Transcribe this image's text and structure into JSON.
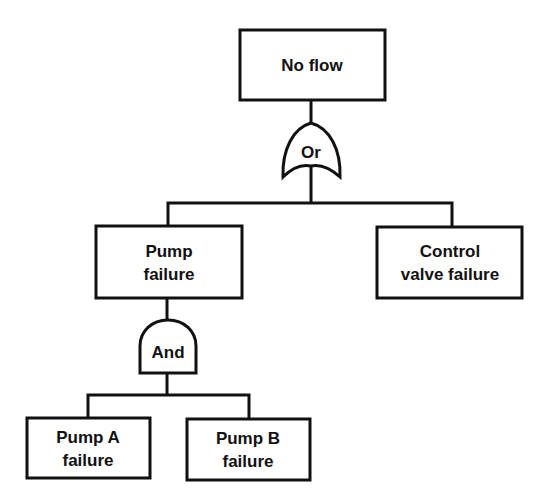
{
  "diagram": {
    "type": "fault-tree",
    "colors": {
      "stroke": "#111111",
      "background": "#ffffff",
      "text": "#111111"
    },
    "top_event": {
      "line1": "No flow"
    },
    "gates": {
      "or_gate": {
        "label": "Or"
      },
      "and_gate": {
        "label": "And"
      }
    },
    "events": {
      "pump_failure": {
        "line1": "Pump",
        "line2": "failure"
      },
      "control_valve_failure": {
        "line1": "Control",
        "line2": "valve failure"
      },
      "pump_a_failure": {
        "line1": "Pump A",
        "line2": "failure"
      },
      "pump_b_failure": {
        "line1": "Pump B",
        "line2": "failure"
      }
    }
  }
}
